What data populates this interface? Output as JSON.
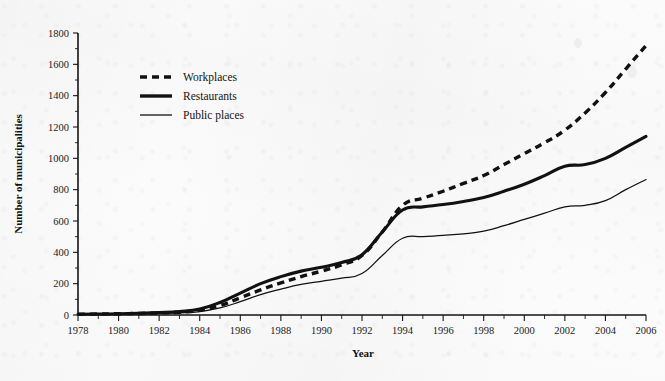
{
  "chart_data": {
    "type": "line",
    "title": "",
    "xlabel": "Year",
    "ylabel": "Number of municipalities",
    "xlim": [
      1978,
      2006
    ],
    "ylim": [
      0,
      1800
    ],
    "grid": false,
    "legend_position": "upper-left",
    "x": [
      1978,
      1979,
      1980,
      1981,
      1982,
      1983,
      1984,
      1985,
      1986,
      1987,
      1988,
      1989,
      1990,
      1991,
      1992,
      1993,
      1994,
      1995,
      1996,
      1997,
      1998,
      1999,
      2000,
      2001,
      2002,
      2003,
      2004,
      2005,
      2006
    ],
    "xticks": [
      1978,
      1980,
      1982,
      1984,
      1986,
      1988,
      1990,
      1992,
      1994,
      1996,
      1998,
      2000,
      2002,
      2004,
      2006
    ],
    "yticks": [
      0,
      200,
      400,
      600,
      800,
      1000,
      1200,
      1400,
      1600,
      1800
    ],
    "series": [
      {
        "name": "Workplaces",
        "style": "thick-dashed",
        "values": [
          5,
          6,
          8,
          10,
          13,
          18,
          30,
          60,
          110,
          160,
          205,
          245,
          280,
          320,
          380,
          530,
          700,
          745,
          790,
          840,
          890,
          960,
          1030,
          1100,
          1180,
          1290,
          1420,
          1570,
          1720
        ]
      },
      {
        "name": "Restaurants",
        "style": "thick-solid",
        "values": [
          5,
          6,
          8,
          11,
          15,
          22,
          38,
          80,
          140,
          200,
          245,
          280,
          305,
          335,
          385,
          530,
          670,
          690,
          705,
          725,
          750,
          790,
          835,
          890,
          950,
          960,
          1000,
          1070,
          1140
        ]
      },
      {
        "name": "Public places",
        "style": "thin-solid",
        "values": [
          4,
          5,
          6,
          8,
          10,
          14,
          22,
          45,
          85,
          130,
          165,
          195,
          215,
          235,
          265,
          380,
          490,
          500,
          508,
          518,
          535,
          570,
          610,
          650,
          690,
          700,
          730,
          800,
          865
        ]
      }
    ]
  },
  "legend": {
    "items": [
      {
        "label": "Workplaces"
      },
      {
        "label": "Restaurants"
      },
      {
        "label": "Public places"
      }
    ]
  },
  "axes": {
    "x_title": "Year",
    "y_title": "Number of municipalities",
    "x_tick_labels": [
      "1978",
      "1980",
      "1982",
      "1984",
      "1986",
      "1988",
      "1990",
      "1992",
      "1994",
      "1996",
      "1998",
      "2000",
      "2002",
      "2004",
      "2006"
    ],
    "y_tick_labels": [
      "0",
      "200",
      "400",
      "600",
      "800",
      "1000",
      "1200",
      "1400",
      "1600",
      "1800"
    ]
  },
  "colors": {
    "ink": "#111111",
    "paper": "#fbfbfb"
  }
}
